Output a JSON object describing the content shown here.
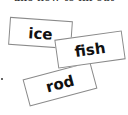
{
  "header": {
    "clipped_text": "ake how to fill out"
  },
  "cards": [
    {
      "word": "ice",
      "rotation_deg": 4
    },
    {
      "word": "fish",
      "rotation_deg": -8
    },
    {
      "word": "rod",
      "rotation_deg": -15
    }
  ],
  "colors": {
    "background": "#ffffff",
    "card_border": "#8a8a8a",
    "text": "#111111"
  }
}
